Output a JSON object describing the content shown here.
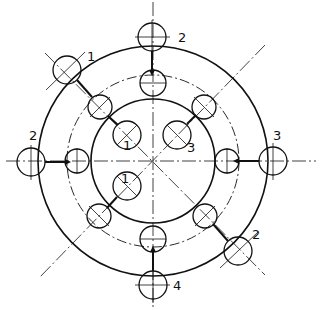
{
  "diagram": {
    "center": [
      153,
      161
    ],
    "outer_circle_radius": 115,
    "inner_circle_radius": 62,
    "bolt_circle_radius": 86,
    "hole_radius": 13,
    "colors": {
      "line": "#111111",
      "background": "#ffffff"
    },
    "labels": {
      "top_outer": "2",
      "upper_left_outer": "1",
      "left_outer": "2",
      "right_outer": "3",
      "lower_right_outer": "2",
      "bottom_outer": "4",
      "inner_upper_left": "1",
      "inner_upper_right": "3",
      "inner_lower_left": "1"
    }
  }
}
